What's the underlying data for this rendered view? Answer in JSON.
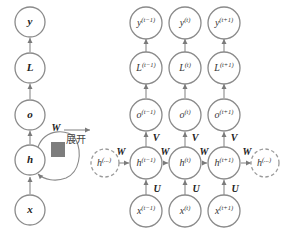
{
  "diagram": {
    "folded": {
      "nodes": [
        {
          "id": "y",
          "label": "y"
        },
        {
          "id": "L",
          "label": "L"
        },
        {
          "id": "o",
          "label": "o"
        },
        {
          "id": "h",
          "label": "h"
        },
        {
          "id": "x",
          "label": "x"
        }
      ],
      "recurrent_weight": "W"
    },
    "unfold_label": "展开",
    "unrolled": {
      "columns": [
        {
          "y": "y",
          "L": "L",
          "o": "o",
          "h": "h",
          "x": "x",
          "sup": "(t−1)"
        },
        {
          "y": "y",
          "L": "L",
          "o": "o",
          "h": "h",
          "x": "x",
          "sup": "(t)"
        },
        {
          "y": "y",
          "L": "L",
          "o": "o",
          "h": "h",
          "x": "x",
          "sup": "(t+1)"
        }
      ],
      "dashed_left": {
        "label": "h",
        "sup": "(...)"
      },
      "dashed_right": {
        "label": "h",
        "sup": "(...)"
      },
      "weights": {
        "W": "W",
        "V": "V",
        "U": "U"
      }
    }
  }
}
